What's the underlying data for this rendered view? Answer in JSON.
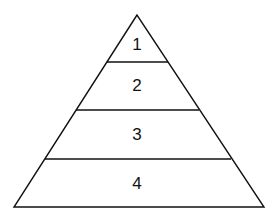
{
  "diagram": {
    "type": "pyramid",
    "levels": [
      {
        "label": "1"
      },
      {
        "label": "2"
      },
      {
        "label": "3"
      },
      {
        "label": "4"
      }
    ],
    "stroke_color": "#111111",
    "background": "#ffffff"
  }
}
